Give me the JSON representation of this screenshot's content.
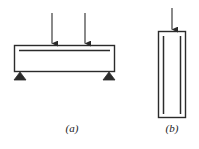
{
  "figure": {
    "type": "engineering-diagram",
    "background_color": "#ffffff",
    "line_color": "#2b2b2b",
    "fill_color": "#ffffff",
    "panels": [
      {
        "id": "a",
        "caption": "(a)",
        "name": "simply-supported-beam",
        "description": "horizontal beam with two point loads and triangular end supports",
        "member": {
          "shape": "rectangle",
          "x": 14,
          "y": 45,
          "width": 101,
          "height": 27
        },
        "reinforcement_lines": [
          {
            "orientation": "horizontal",
            "x1": 19,
            "y1": 50,
            "x2": 110,
            "y2": 50
          }
        ],
        "loads": [
          {
            "name": "point-load-1",
            "x": 52,
            "y_start": 13,
            "y_end": 45,
            "direction": "down"
          },
          {
            "name": "point-load-2",
            "x": 85,
            "y_start": 13,
            "y_end": 45,
            "direction": "down"
          }
        ],
        "supports": [
          {
            "name": "support-left",
            "x": 20,
            "y": 72,
            "half_width": 6,
            "height": 8,
            "type": "triangular"
          },
          {
            "name": "support-right",
            "x": 109,
            "y": 72,
            "half_width": 6,
            "height": 8,
            "type": "triangular"
          }
        ]
      },
      {
        "id": "b",
        "caption": "(b)",
        "name": "axially-loaded-column",
        "description": "vertical column with axial point load and two longitudinal reinforcement bars",
        "member": {
          "shape": "rectangle",
          "x": 158,
          "y": 31,
          "width": 28,
          "height": 87
        },
        "reinforcement_lines": [
          {
            "orientation": "vertical",
            "x1": 163,
            "y1": 36,
            "x2": 163,
            "y2": 114
          },
          {
            "orientation": "vertical",
            "x1": 181,
            "y1": 36,
            "x2": 181,
            "y2": 114
          }
        ],
        "loads": [
          {
            "name": "axial-load",
            "x": 172,
            "y_start": 8,
            "y_end": 31,
            "direction": "down"
          }
        ],
        "supports": []
      }
    ]
  }
}
